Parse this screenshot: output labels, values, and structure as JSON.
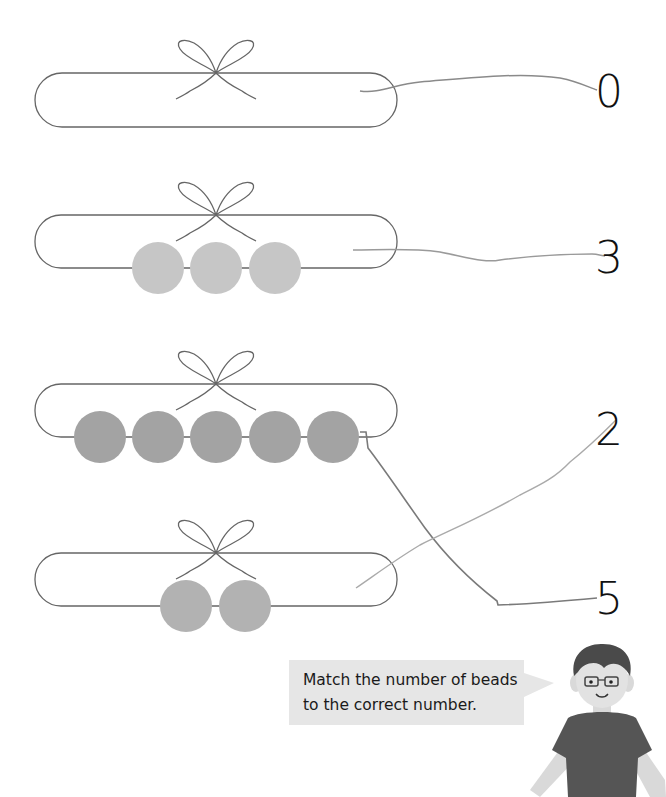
{
  "worksheet": {
    "instruction": {
      "line1": "Match the number of beads",
      "line2": "to the correct number."
    },
    "rows": [
      {
        "id": "ring-1",
        "bead_count": 0,
        "bead_color": "#c8c8c8",
        "matched_to": "0"
      },
      {
        "id": "ring-2",
        "bead_count": 3,
        "bead_color": "#c6c6c6",
        "matched_to": "3"
      },
      {
        "id": "ring-3",
        "bead_count": 5,
        "bead_color": "#a3a3a3",
        "matched_to": "5"
      },
      {
        "id": "ring-4",
        "bead_count": 2,
        "bead_color": "#b2b2b2",
        "matched_to": "2"
      }
    ],
    "numbers": [
      {
        "label": "0"
      },
      {
        "label": "3"
      },
      {
        "label": "2"
      },
      {
        "label": "5"
      }
    ],
    "colors": {
      "ring_stroke": "#666666",
      "match_line": "#8a8a8a",
      "bubble_bg": "#e6e6e6",
      "shirt": "#555555",
      "skin": "#d9d9d9",
      "hair": "#4a4a4a"
    }
  }
}
